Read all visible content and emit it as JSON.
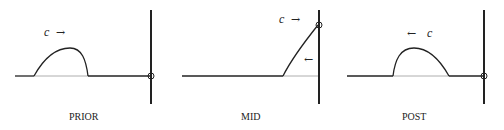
{
  "panels": [
    {
      "id": "prior",
      "caption": "PRIOR",
      "speed_label": "c",
      "direction_arrow": "→",
      "description": "Pulse traveling right toward fixed wall"
    },
    {
      "id": "mid",
      "caption": "MID",
      "speed_label": "c",
      "direction_arrow": "→",
      "reflected_arrow": "←",
      "description": "Pulse meeting the wall"
    },
    {
      "id": "post",
      "caption": "POST",
      "speed_label": "c",
      "direction_arrow": "←",
      "description": "Reflected pulse traveling left"
    }
  ],
  "colors": {
    "line": "#222222",
    "baseline_under_pulse": "#888888",
    "background": "#ffffff"
  }
}
